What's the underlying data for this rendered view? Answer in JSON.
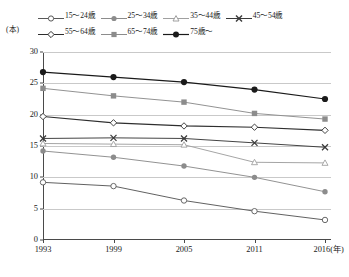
{
  "chart_data": {
    "type": "line",
    "title": "",
    "xlabel": "年",
    "ylabel": "本",
    "unit_label": "(本)",
    "x_unit_suffix": "(年)",
    "categories": [
      "1993",
      "1999",
      "2005",
      "2011",
      "2016"
    ],
    "x_tick_labels": [
      "1993",
      "1999",
      "2005",
      "2011",
      "2016(年)"
    ],
    "y_tick_labels": [
      "0",
      "5",
      "10",
      "15",
      "20",
      "25",
      "30"
    ],
    "y_ticks": [
      0,
      5,
      10,
      15,
      20,
      25,
      30
    ],
    "ylim": [
      0,
      30
    ],
    "grid": true,
    "legend_position": "top",
    "series": [
      {
        "name": "15～24歳",
        "marker": "open-circle",
        "color": "#585858",
        "values": [
          9.2,
          8.6,
          6.3,
          4.6,
          3.2
        ]
      },
      {
        "name": "25～34歳",
        "marker": "filled-circle-gray",
        "color": "#8c8c8c",
        "values": [
          14.2,
          13.2,
          11.8,
          10.0,
          7.7
        ]
      },
      {
        "name": "35～44歳",
        "marker": "open-triangle",
        "color": "#a0a0a0",
        "values": [
          15.4,
          15.3,
          15.2,
          12.4,
          12.3
        ]
      },
      {
        "name": "45～54歳",
        "marker": "cross-x",
        "color": "#3a3a3a",
        "values": [
          16.2,
          16.3,
          16.2,
          15.5,
          14.8
        ]
      },
      {
        "name": "55～64歳",
        "marker": "open-diamond",
        "color": "#2e2e2e",
        "values": [
          19.7,
          18.7,
          18.2,
          18.0,
          17.5
        ]
      },
      {
        "name": "65～74歳",
        "marker": "filled-square-gray",
        "color": "#8c8c8c",
        "values": [
          24.2,
          23.0,
          22.0,
          20.2,
          19.3
        ]
      },
      {
        "name": "75歳～",
        "marker": "filled-circle-black",
        "color": "#1a1a1a",
        "values": [
          26.8,
          26.0,
          25.2,
          24.0,
          22.5
        ]
      }
    ]
  },
  "colors": {
    "axis": "#4a4a4a",
    "grid": "#c9c9c9",
    "background": "#ffffff"
  }
}
